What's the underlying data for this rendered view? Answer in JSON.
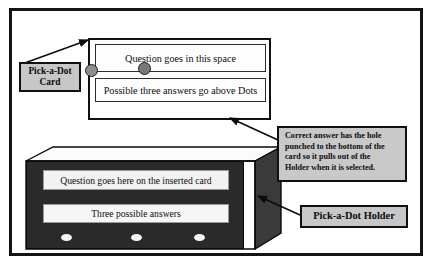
{
  "figure": {
    "background_color": "#ffffff",
    "border_color": "#141414",
    "label_fill_color": "#c7c7c7",
    "holder_fill_color": "#2a2a2a",
    "dot_color": "#8e8e8e"
  },
  "card": {
    "question_text": "Question goes in this space",
    "answers_text": "Possible three answers go above Dots",
    "dots": [
      {
        "name": "dot-1",
        "state": "normal"
      },
      {
        "name": "dot-2",
        "state": "normal"
      },
      {
        "name": "dot-3",
        "state": "correct"
      }
    ]
  },
  "labels": {
    "card_label": "Pick-a-Dot Card",
    "card_label_line1": "Pick-a-Dot",
    "card_label_line2": "Card",
    "holder_label": "Pick-a-Dot Holder"
  },
  "callout": {
    "text": "Correct answer has the hole punched to the bottom of the card so it pulls out of the Holder when it is selected.",
    "line1": "Correct answer has the hole",
    "line2": "punched to the bottom of the",
    "line3": "card so it pulls out of the",
    "line4": "Holder when it is selected."
  },
  "holder": {
    "question_text": "Question goes here on the inserted card",
    "answers_text": "Three possible answers",
    "dots": [
      {
        "name": "holder-dot-1"
      },
      {
        "name": "holder-dot-2"
      },
      {
        "name": "holder-dot-3"
      }
    ]
  }
}
